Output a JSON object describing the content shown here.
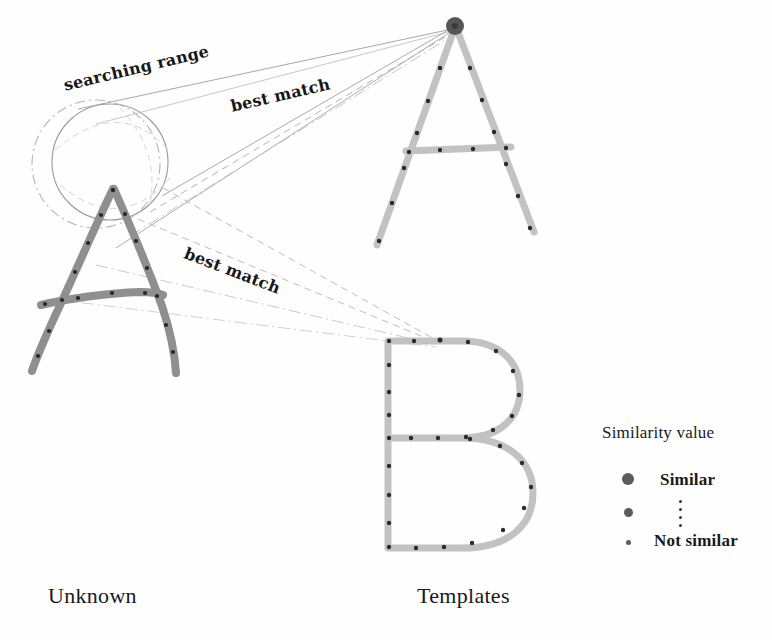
{
  "figure": {
    "kind": "template-matching-diagram",
    "background_color": "#fefefe"
  },
  "labels": {
    "searching_range": "searching range",
    "best_match_top": "best match",
    "best_match_bottom": "best match",
    "unknown_caption": "Unknown",
    "templates_caption": "Templates"
  },
  "legend": {
    "title": "Similarity value",
    "items": [
      {
        "label": "Similar",
        "dot_px": 12
      },
      {
        "label": "",
        "dot_px": 9
      },
      {
        "label": "Not similar",
        "dot_px": 5
      }
    ],
    "vertical_dots_count": 4,
    "dot_color": "#5c5c5c"
  },
  "shapes": {
    "unknown_letter": "A",
    "template_letters": [
      "A",
      "B"
    ],
    "stroke_color_unknown": "#8d8d8d",
    "stroke_color_template": "#bdbdbd",
    "feature_point_color": "#2b2b2b",
    "highlight_point_color": "#555555",
    "searching_circle_solid_color": "#9a9a9a",
    "searching_circle_dashed_color": "#b4b4b4",
    "connector_solid_color": "#8f8f8f",
    "connector_dashed_color": "#b0b0b0"
  },
  "geometry": {
    "searching_circle_solid": {
      "cx": 110,
      "cy": 162,
      "r": 58
    },
    "searching_circle_dashed": {
      "cx": 96,
      "cy": 164,
      "r": 64
    },
    "template_a_apex": {
      "x": 455,
      "y": 25
    },
    "template_b_anchor": {
      "x": 440,
      "y": 340
    },
    "unknown_a_apex": {
      "x": 112,
      "y": 188
    }
  }
}
